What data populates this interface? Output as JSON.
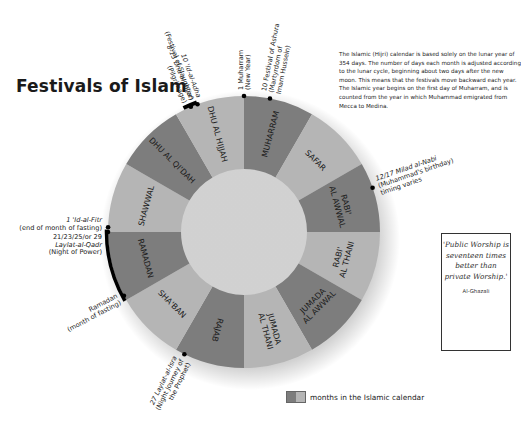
{
  "title": "Festivals of Islam",
  "intro": "The Islamic (Hijri) calendar is based solely on the lunar year of 354 days. The number of days each month is adjusted according to the lunar cycle, beginning about two days after the new moon. This means that the festivals move backward each year. The Islamic year begins on the first day of Muharram, and is counted from the year in which Muhammad emigrated from Mecca to Medina.",
  "quote": {
    "text": "'Public Worship is seventeen times better than private Worship.'",
    "author": "Al-Ghazali"
  },
  "legend": {
    "label": "months in the Islamic calendar",
    "dark_color": "#7d7d7d",
    "light_color": "#b5b5b5"
  },
  "wheel": {
    "center": [
      244,
      232
    ],
    "outer_radius": 136,
    "inner_radius": 63,
    "colors": {
      "dark": "#7d7d7d",
      "light": "#b5b5b5"
    },
    "months": [
      {
        "name": [
          "MUHARRAM"
        ],
        "shade": "dark"
      },
      {
        "name": [
          "SAFAR"
        ],
        "shade": "light"
      },
      {
        "name": [
          "RABI'",
          "AL AWWAL"
        ],
        "shade": "dark"
      },
      {
        "name": [
          "RABI'",
          "AL THANI"
        ],
        "shade": "light"
      },
      {
        "name": [
          "JUMADA",
          "AL AWWAL"
        ],
        "shade": "dark"
      },
      {
        "name": [
          "JUMADA",
          "AL THANI"
        ],
        "shade": "light"
      },
      {
        "name": [
          "RAJAB"
        ],
        "shade": "dark"
      },
      {
        "name": [
          "SHA'BAN"
        ],
        "shade": "light"
      },
      {
        "name": [
          "RAMADAN"
        ],
        "shade": "dark"
      },
      {
        "name": [
          "SHAWWAL"
        ],
        "shade": "light"
      },
      {
        "name": [
          "DHU AL QI'DAH"
        ],
        "shade": "dark"
      },
      {
        "name": [
          "DHU AL HIJJAH"
        ],
        "shade": "light"
      }
    ]
  },
  "festivals": [
    {
      "angle": 0,
      "lines": [
        {
          "t": "1 Muharram",
          "i": false
        },
        {
          "t": "(New Year)",
          "i": false
        }
      ]
    },
    {
      "angle": 11,
      "lines": [
        {
          "t": "10 Festival of Ashura",
          "i": false
        },
        {
          "t": "(Martyrdom of",
          "i": false
        },
        {
          "t": "Imam Hussein)",
          "i": false
        }
      ]
    },
    {
      "angle": 71,
      "lines": [
        {
          "t": "12/17 Milad al-Nabi",
          "i": true
        },
        {
          "t": "(Muhammad's birthday)",
          "i": false
        },
        {
          "t": "timing varies",
          "i": false
        }
      ]
    },
    {
      "angle": 206,
      "lines": [
        {
          "t": "27 Laylat-al-Isra",
          "i": true
        },
        {
          "t": "(Night Journey of",
          "i": false
        },
        {
          "t": "the Prophet)",
          "i": false
        }
      ]
    },
    {
      "angle": 242,
      "lines": [
        {
          "t": "Ramadan",
          "i": false
        },
        {
          "t": "(month of fasting)",
          "i": false
        }
      ]
    },
    {
      "angle": 270,
      "lines": [
        {
          "t": "1 'Id-al-Fitr",
          "i": true
        },
        {
          "t": "(end of month of fasting)",
          "i": false
        }
      ]
    },
    {
      "angle": 272,
      "lines": [
        {
          "t": "21/23/25/or 29",
          "i": false
        },
        {
          "t": "Laylat-al-Qadr",
          "i": true
        },
        {
          "t": "(Night of Power)",
          "i": false
        }
      ]
    },
    {
      "angle": 340,
      "lines": [
        {
          "t": "10 'Id-al-Adha",
          "i": true
        },
        {
          "t": "(Festival of Slaughter)",
          "i": false
        }
      ]
    },
    {
      "angle": 337,
      "lines": [
        {
          "t": "8-13 Dhu al Hijjah",
          "i": true
        },
        {
          "t": "(Pilgrimage)",
          "i": false
        }
      ]
    }
  ]
}
